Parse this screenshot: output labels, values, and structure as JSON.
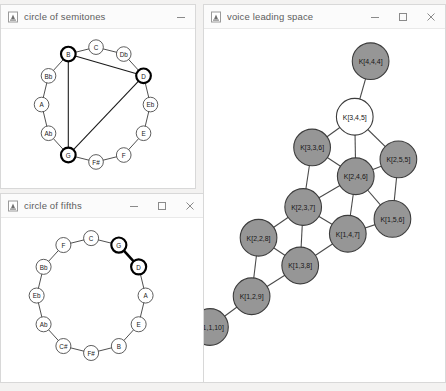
{
  "desktop": {
    "background": "#f3f2f1"
  },
  "windows": [
    {
      "id": "circle-of-semitones",
      "title": "circle of semitones",
      "icon": "app-icon",
      "buttons": {
        "minimize": "minimize",
        "maximize": null,
        "close": null
      },
      "frame": {
        "x": 0,
        "y": 4,
        "w": 196,
        "h": 185
      }
    },
    {
      "id": "circle-of-fifths",
      "title": "circle of fifths",
      "icon": "app-icon",
      "buttons": {
        "minimize": "minimize",
        "maximize": "maximize",
        "close": "close"
      },
      "frame": {
        "x": 0,
        "y": 193,
        "w": 205,
        "h": 190
      }
    },
    {
      "id": "voice-leading-space",
      "title": "voice leading space",
      "icon": "app-icon",
      "buttons": {
        "minimize": "minimize",
        "maximize": "maximize",
        "close": "close"
      },
      "frame": {
        "x": 203,
        "y": 4,
        "w": 243,
        "h": 379
      }
    }
  ],
  "chart_data": [
    {
      "type": "graph",
      "id": "circle-of-semitones",
      "title": "circle of semitones",
      "description": "Twelve pitch classes arranged in a circle by semitone, with a triangle drawn between three highlighted notes.",
      "nodes": [
        {
          "id": "C",
          "label": "C",
          "x": 96,
          "y": 18,
          "highlighted": false
        },
        {
          "id": "Db",
          "label": "Db",
          "x": 124,
          "y": 25,
          "highlighted": false
        },
        {
          "id": "D",
          "label": "D",
          "x": 144,
          "y": 47,
          "highlighted": true
        },
        {
          "id": "Eb",
          "label": "Eb",
          "x": 151,
          "y": 76,
          "highlighted": false
        },
        {
          "id": "E",
          "label": "E",
          "x": 144,
          "y": 105,
          "highlighted": false
        },
        {
          "id": "F",
          "label": "F",
          "x": 124,
          "y": 127,
          "highlighted": false
        },
        {
          "id": "Gb",
          "label": "F#",
          "x": 96,
          "y": 134,
          "highlighted": false
        },
        {
          "id": "G",
          "label": "G",
          "x": 68,
          "y": 127,
          "highlighted": true
        },
        {
          "id": "Ab",
          "label": "Ab",
          "x": 48,
          "y": 105,
          "highlighted": false
        },
        {
          "id": "A",
          "label": "A",
          "x": 41,
          "y": 76,
          "highlighted": false
        },
        {
          "id": "Bb",
          "label": "Bb",
          "x": 48,
          "y": 47,
          "highlighted": false
        },
        {
          "id": "B",
          "label": "B",
          "x": 68,
          "y": 25,
          "highlighted": true
        }
      ],
      "ring_edges": [
        [
          "C",
          "Db"
        ],
        [
          "Db",
          "D"
        ],
        [
          "D",
          "Eb"
        ],
        [
          "Eb",
          "E"
        ],
        [
          "E",
          "F"
        ],
        [
          "F",
          "Gb"
        ],
        [
          "Gb",
          "G"
        ],
        [
          "G",
          "Ab"
        ],
        [
          "Ab",
          "A"
        ],
        [
          "A",
          "Bb"
        ],
        [
          "Bb",
          "B"
        ],
        [
          "B",
          "C"
        ]
      ],
      "chord_edges": [
        [
          "B",
          "D"
        ],
        [
          "D",
          "G"
        ],
        [
          "G",
          "B"
        ]
      ],
      "highlighted_nodes": [
        "B",
        "D",
        "G"
      ]
    },
    {
      "type": "graph",
      "id": "circle-of-fifths",
      "title": "circle of fifths",
      "description": "Twelve pitch classes arranged in a circle by perfect fifth, with the G-D edge highlighted.",
      "nodes": [
        {
          "id": "C",
          "label": "C",
          "x": 91,
          "y": 20,
          "highlighted": false
        },
        {
          "id": "G",
          "label": "G",
          "x": 119,
          "y": 27,
          "highlighted": true
        },
        {
          "id": "D",
          "label": "D",
          "x": 139,
          "y": 49,
          "highlighted": true
        },
        {
          "id": "A",
          "label": "A",
          "x": 146,
          "y": 78,
          "highlighted": false
        },
        {
          "id": "E",
          "label": "E",
          "x": 139,
          "y": 107,
          "highlighted": false
        },
        {
          "id": "B",
          "label": "B",
          "x": 119,
          "y": 129,
          "highlighted": false
        },
        {
          "id": "Gb",
          "label": "F#",
          "x": 91,
          "y": 136,
          "highlighted": false
        },
        {
          "id": "Db",
          "label": "C#",
          "x": 63,
          "y": 129,
          "highlighted": false
        },
        {
          "id": "Ab",
          "label": "Ab",
          "x": 43,
          "y": 107,
          "highlighted": false
        },
        {
          "id": "Eb",
          "label": "Eb",
          "x": 36,
          "y": 78,
          "highlighted": false
        },
        {
          "id": "Bb",
          "label": "Bb",
          "x": 43,
          "y": 49,
          "highlighted": false
        },
        {
          "id": "F",
          "label": "F",
          "x": 63,
          "y": 27,
          "highlighted": false
        }
      ],
      "ring_edges": [
        [
          "C",
          "G"
        ],
        [
          "G",
          "D"
        ],
        [
          "D",
          "A"
        ],
        [
          "A",
          "E"
        ],
        [
          "E",
          "B"
        ],
        [
          "B",
          "Gb"
        ],
        [
          "Gb",
          "Db"
        ],
        [
          "Db",
          "Ab"
        ],
        [
          "Ab",
          "Eb"
        ],
        [
          "Eb",
          "Bb"
        ],
        [
          "Bb",
          "F"
        ],
        [
          "F",
          "C"
        ]
      ],
      "highlighted_edges": [
        [
          "G",
          "D"
        ]
      ],
      "highlighted_nodes": [
        "G",
        "D"
      ]
    },
    {
      "type": "graph",
      "id": "voice-leading-space",
      "title": "voice leading space",
      "description": "Lattice of three-note chord types K[a,b,c] connected by single-semitone voice leading. Node fill indicates whether the chord type is selected (white) or not (gray).",
      "node_fill_selected": "#ffffff",
      "node_fill_default": "#969696",
      "nodes": [
        {
          "id": "K444",
          "label": "K[4,4,4]",
          "x": 168,
          "y": 31,
          "selected": false
        },
        {
          "id": "K345",
          "label": "K[3,4,5]",
          "x": 152,
          "y": 87,
          "selected": true
        },
        {
          "id": "K336",
          "label": "K[3,3,6]",
          "x": 109,
          "y": 118,
          "selected": false
        },
        {
          "id": "K255",
          "label": "K[2,5,5]",
          "x": 196,
          "y": 130,
          "selected": false
        },
        {
          "id": "K246",
          "label": "K[2,4,6]",
          "x": 153,
          "y": 147,
          "selected": false
        },
        {
          "id": "K237",
          "label": "K[2,3,7]",
          "x": 100,
          "y": 178,
          "selected": false
        },
        {
          "id": "K156",
          "label": "K[1,5,6]",
          "x": 190,
          "y": 190,
          "selected": false
        },
        {
          "id": "K147",
          "label": "K[1,4,7]",
          "x": 145,
          "y": 205,
          "selected": false
        },
        {
          "id": "K228",
          "label": "K[2,2,8]",
          "x": 55,
          "y": 209,
          "selected": false
        },
        {
          "id": "K138",
          "label": "K[1,3,8]",
          "x": 97,
          "y": 237,
          "selected": false
        },
        {
          "id": "K129",
          "label": "K[1,2,9]",
          "x": 48,
          "y": 268,
          "selected": false
        },
        {
          "id": "K1110",
          "label": "K[1,1,10]",
          "x": 6,
          "y": 299,
          "selected": false
        }
      ],
      "edges": [
        [
          "K444",
          "K345"
        ],
        [
          "K345",
          "K336"
        ],
        [
          "K345",
          "K246"
        ],
        [
          "K345",
          "K255"
        ],
        [
          "K336",
          "K246"
        ],
        [
          "K336",
          "K237"
        ],
        [
          "K255",
          "K246"
        ],
        [
          "K255",
          "K156"
        ],
        [
          "K246",
          "K237"
        ],
        [
          "K246",
          "K147"
        ],
        [
          "K246",
          "K156"
        ],
        [
          "K237",
          "K228"
        ],
        [
          "K237",
          "K138"
        ],
        [
          "K237",
          "K147"
        ],
        [
          "K156",
          "K147"
        ],
        [
          "K147",
          "K138"
        ],
        [
          "K228",
          "K138"
        ],
        [
          "K228",
          "K129"
        ],
        [
          "K138",
          "K129"
        ],
        [
          "K129",
          "K1110"
        ]
      ]
    }
  ]
}
